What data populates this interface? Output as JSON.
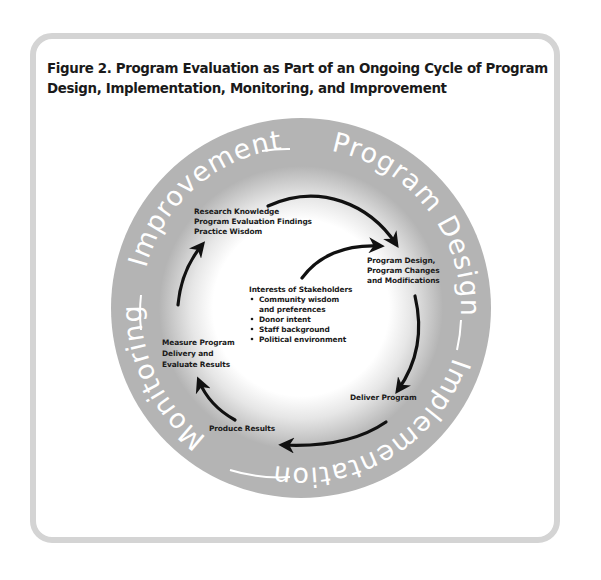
{
  "figure": {
    "title_line1": "Figure 2. Program Evaluation as Part of an Ongoing Cycle of Program",
    "title_line2": "Design, Implementation, Monitoring, and Improvement"
  },
  "ring": {
    "segments": [
      "Program Design",
      "Implementation",
      "Monitoring",
      "Improvement"
    ],
    "color": "#b4b4b4"
  },
  "cycle": {
    "research": [
      "Research Knowledge",
      "Program Evaluation Findings",
      "Practice Wisdom"
    ],
    "design": [
      "Program Design,",
      "Program Changes",
      "and Modifications"
    ],
    "deliver": "Deliver Program",
    "produce": "Produce Results",
    "measure": [
      "Measure Program",
      "Delivery and",
      "Evaluate Results"
    ]
  },
  "stakeholders": {
    "heading": "Interests of Stakeholders",
    "bullets": [
      "Community wisdom",
      "and preferences",
      "Donor intent",
      "Staff background",
      "Political environment"
    ]
  },
  "colors": {
    "frame": "#d4d4d4",
    "ring": "#b4b4b4",
    "arrow": "#111111",
    "text": "#1a1a1a"
  }
}
